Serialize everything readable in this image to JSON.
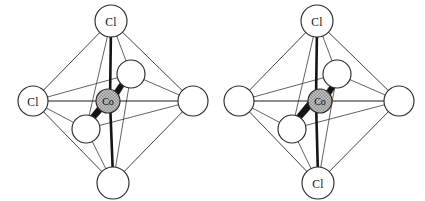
{
  "figure": {
    "canvas": {
      "width": 425,
      "height": 201,
      "background": "#ffffff"
    },
    "line_color": "#2b2b2b",
    "metal_fill_color": "#b9b9b9",
    "ligand_fill_color": "#ffffff"
  },
  "structures": [
    {
      "id": "structure-left",
      "isomer": "cis",
      "center": {
        "label": "Co",
        "x": 108,
        "y": 101,
        "r": 12
      },
      "vertices": [
        {
          "key": "top",
          "label": "Cl",
          "x": 111,
          "y": 21,
          "r": 16,
          "bond": "thick"
        },
        {
          "key": "bottom",
          "label": "",
          "x": 113,
          "y": 183,
          "r": 16,
          "bond": "thick"
        },
        {
          "key": "left",
          "label": "Cl",
          "x": 33,
          "y": 101,
          "r": 15,
          "bond": "thin"
        },
        {
          "key": "right",
          "label": "",
          "x": 193,
          "y": 101,
          "r": 15,
          "bond": "thin"
        },
        {
          "key": "front",
          "label": "",
          "x": 131,
          "y": 74,
          "r": 14,
          "bond": "wedge"
        },
        {
          "key": "back",
          "label": "",
          "x": 86,
          "y": 129,
          "r": 14,
          "bond": "wedge"
        }
      ]
    },
    {
      "id": "structure-right",
      "isomer": "trans",
      "center": {
        "label": "Co",
        "x": 320,
        "y": 101,
        "r": 12
      },
      "vertices": [
        {
          "key": "top",
          "label": "Cl",
          "x": 317,
          "y": 21,
          "r": 16,
          "bond": "thick"
        },
        {
          "key": "bottom",
          "label": "Cl",
          "x": 318,
          "y": 183,
          "r": 16,
          "bond": "thick"
        },
        {
          "key": "left",
          "label": "",
          "x": 239,
          "y": 101,
          "r": 15,
          "bond": "thin"
        },
        {
          "key": "right",
          "label": "",
          "x": 399,
          "y": 101,
          "r": 15,
          "bond": "thin"
        },
        {
          "key": "front",
          "label": "",
          "x": 337,
          "y": 74,
          "r": 14,
          "bond": "wedge"
        },
        {
          "key": "back",
          "label": "",
          "x": 292,
          "y": 129,
          "r": 14,
          "bond": "wedge"
        }
      ]
    }
  ],
  "labels": {
    "chlorine": "Cl",
    "cobalt": "Co"
  }
}
